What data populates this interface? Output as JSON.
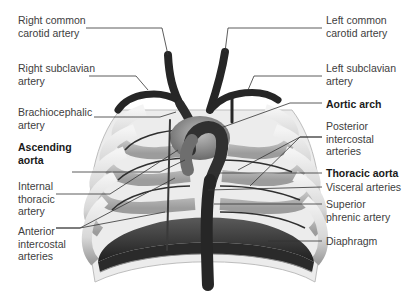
{
  "diagram": {
    "labels_left": [
      {
        "id": "right-common-carotid",
        "text": "Right common\ncarotid artery",
        "bold": false
      },
      {
        "id": "right-subclavian",
        "text": "Right subclavian\nartery",
        "bold": false
      },
      {
        "id": "brachiocephalic",
        "text": "Brachiocephalic\nartery",
        "bold": false
      },
      {
        "id": "ascending-aorta",
        "text": "Ascending\naorta",
        "bold": true
      },
      {
        "id": "internal-thoracic",
        "text": "Internal\nthoracic\nartery",
        "bold": false
      },
      {
        "id": "anterior-intercostal",
        "text": "Anterior\nintercostal\narteries",
        "bold": false
      }
    ],
    "labels_right": [
      {
        "id": "left-common-carotid",
        "text": "Left common\ncarotid artery",
        "bold": false
      },
      {
        "id": "left-subclavian",
        "text": "Left subclavian\nartery",
        "bold": false
      },
      {
        "id": "aortic-arch",
        "text": "Aortic arch",
        "bold": true
      },
      {
        "id": "posterior-intercostal",
        "text": "Posterior\nintercostal\narteries",
        "bold": false
      },
      {
        "id": "thoracic-aorta",
        "text": "Thoracic aorta",
        "bold": true
      },
      {
        "id": "visceral-arteries",
        "text": "Visceral arteries",
        "bold": false
      },
      {
        "id": "superior-phrenic",
        "text": "Superior\nphrenic artery",
        "bold": false
      },
      {
        "id": "diaphragm",
        "text": "Diaphragm",
        "bold": false
      }
    ],
    "colors": {
      "vessel": "#2a2a2a",
      "rib_light": "#e6e6e6",
      "rib_shadow": "#9a9a9a",
      "diaphragm": "#3a3a3a",
      "leader": "#333333",
      "label": "#404040"
    }
  }
}
